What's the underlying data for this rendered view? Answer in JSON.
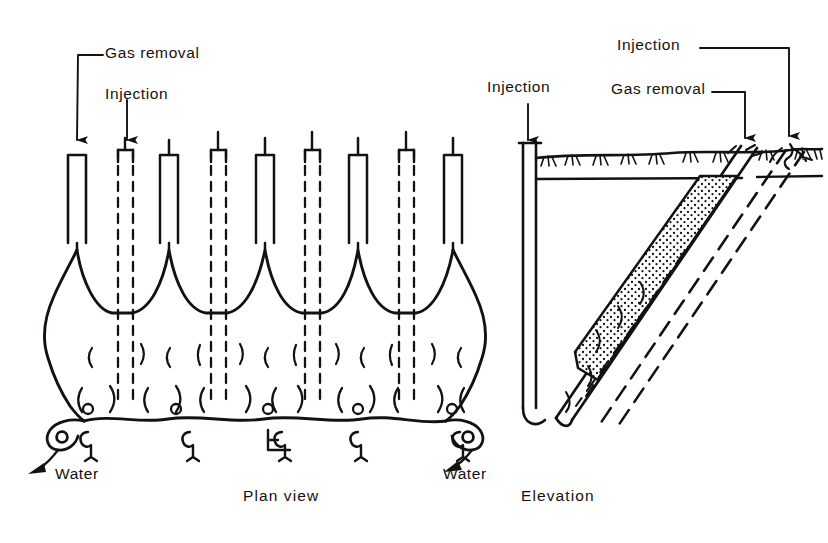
{
  "figure": {
    "title": "",
    "views": [
      {
        "id": "plan",
        "caption": "Plan view"
      },
      {
        "id": "elevation",
        "caption": "Elevation"
      }
    ]
  },
  "plan_view": {
    "caption": "Plan view",
    "labels": {
      "gas_removal": "Gas removal",
      "injection": "Injection",
      "water_left": "Water",
      "water_right": "Water"
    },
    "wells": {
      "gas_removal_count": 5,
      "injection_count": 4,
      "gas_removal_style": "solid",
      "injection_style": "dashed",
      "gas_removal_x": [
        75,
        168,
        264,
        357,
        452
      ],
      "injection_x": [
        125,
        218,
        312,
        406
      ],
      "well_top_y": 152,
      "gas_removal_bottom_y": 248,
      "injection_bottom_y": 400
    },
    "icons": {
      "arrow_down": "arrow-down-icon",
      "water_arrow": "water-flow-arrow-icon"
    }
  },
  "elevation_view": {
    "caption": "Elevation",
    "labels": {
      "injection_left": "Injection",
      "gas_removal": "Gas removal",
      "injection_right": "Injection"
    },
    "features": {
      "ground_surface": "ground-surface-grass",
      "vertical_well_x": 528,
      "gas_removal_well_head_x": 745,
      "injection_well_head_x": 788,
      "stipple_zone": "gas-accumulation-zone",
      "well_style_solid": "solid",
      "well_style_dashed": "dashed"
    }
  },
  "colors": {
    "ink": "#15110f",
    "paper": "#ffffff"
  }
}
